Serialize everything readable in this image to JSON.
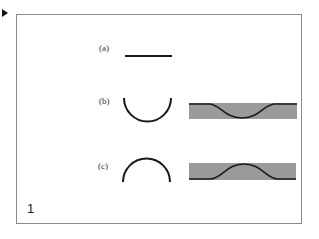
{
  "slide": {
    "marker_icon": "play-triangle-icon",
    "figure_number": "1",
    "panels": [
      {
        "label": "(a)",
        "shape": "flat-line"
      },
      {
        "label": "(b)",
        "shape": "concave-up-arc",
        "band": "dip-band"
      },
      {
        "label": "(c)",
        "shape": "concave-down-arc",
        "band": "bump-band"
      }
    ],
    "colors": {
      "band_fill": "#9a9a9a",
      "stroke": "#1a1a1a",
      "frame": "#8a8a8a"
    }
  }
}
